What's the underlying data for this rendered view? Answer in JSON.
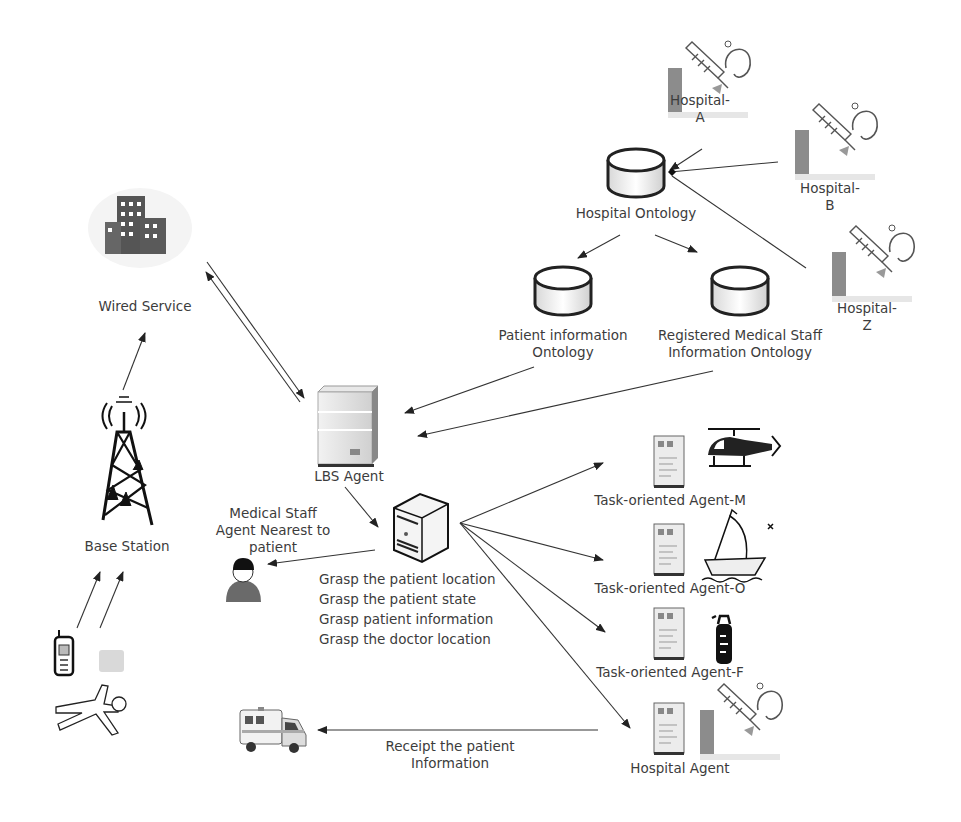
{
  "diagram": {
    "type": "system-architecture",
    "nodes": {
      "hospital_a": {
        "label_line1": "Hospital-",
        "label_line2": "A",
        "icon": "hospital-icon"
      },
      "hospital_b": {
        "label_line1": "Hospital-",
        "label_line2": "B",
        "icon": "hospital-icon"
      },
      "hospital_z": {
        "label_line1": "Hospital-",
        "label_line2": "Z",
        "icon": "hospital-icon"
      },
      "hospital_ontology": {
        "label": "Hospital Ontology",
        "icon": "database-icon"
      },
      "patient_ontology": {
        "label_line1": "Patient information",
        "label_line2": "Ontology",
        "icon": "database-icon"
      },
      "staff_ontology": {
        "label_line1": "Registered Medical Staff",
        "label_line2": "Information Ontology",
        "icon": "database-icon"
      },
      "wired_service": {
        "label": "Wired Service",
        "icon": "building-icon"
      },
      "base_station": {
        "label": "Base Station",
        "icon": "antenna-tower-icon"
      },
      "lbs_agent": {
        "label": "LBS Agent",
        "icon": "server-icon"
      },
      "central_server": {
        "icon": "tower-server-icon",
        "tasks": [
          "Grasp the patient location",
          "Grasp the patient state",
          "Grasp patient information",
          "Grasp the doctor location"
        ]
      },
      "medical_staff": {
        "label_line1": "Medical Staff",
        "label_line2": "Agent Nearest to",
        "label_line3": "patient",
        "icon": "person-icon"
      },
      "agent_m": {
        "label": "Task-oriented Agent-M",
        "icon": "helicopter-icon"
      },
      "agent_o": {
        "label": "Task-oriented Agent-O",
        "icon": "boat-icon"
      },
      "agent_f": {
        "label": "Task-oriented Agent-F",
        "icon": "fire-extinguisher-icon"
      },
      "hospital_agent": {
        "label": "Hospital Agent",
        "icon": "hospital-icon"
      },
      "ambulance": {
        "icon": "ambulance-icon"
      },
      "patient": {
        "icon": "fallen-person-icon",
        "devices": [
          "mobile-phone-icon",
          "sensor-device-icon"
        ]
      },
      "receipt": {
        "label_line1": "Receipt the patient",
        "label_line2": "Information"
      }
    },
    "edges": [
      {
        "from": "hospital_a",
        "to": "hospital_ontology"
      },
      {
        "from": "hospital_b",
        "to": "hospital_ontology"
      },
      {
        "from": "hospital_z",
        "to": "hospital_ontology"
      },
      {
        "from": "hospital_ontology",
        "to": "patient_ontology"
      },
      {
        "from": "hospital_ontology",
        "to": "staff_ontology"
      },
      {
        "from": "patient_ontology",
        "to": "lbs_agent"
      },
      {
        "from": "staff_ontology",
        "to": "lbs_agent"
      },
      {
        "from": "wired_service",
        "to": "lbs_agent",
        "bidirectional": true
      },
      {
        "from": "base_station",
        "to": "wired_service"
      },
      {
        "from": "patient",
        "to": "base_station"
      },
      {
        "from": "lbs_agent",
        "to": "central_server"
      },
      {
        "from": "central_server",
        "to": "medical_staff"
      },
      {
        "from": "central_server",
        "to": "agent_m"
      },
      {
        "from": "central_server",
        "to": "agent_o"
      },
      {
        "from": "central_server",
        "to": "agent_f"
      },
      {
        "from": "central_server",
        "to": "hospital_agent"
      },
      {
        "from": "hospital_agent",
        "to": "ambulance"
      }
    ]
  }
}
